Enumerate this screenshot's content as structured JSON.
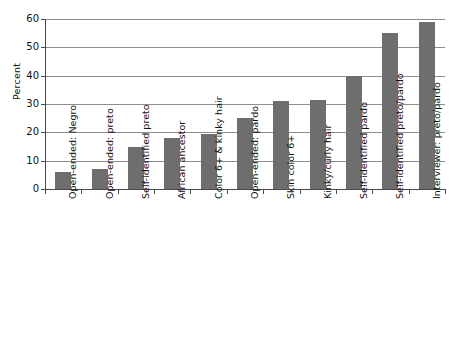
{
  "chart_data": {
    "type": "bar",
    "title": "",
    "subtitle": "",
    "xlabel": "",
    "ylabel": "Percent",
    "ylim": [
      0,
      60
    ],
    "yticks": [
      0,
      10,
      20,
      30,
      40,
      50,
      60
    ],
    "ytick_labels": [
      "0",
      "10",
      "20",
      "30",
      "40",
      "50",
      "60"
    ],
    "grid": true,
    "legend": false,
    "legend_position": "none",
    "orientation": "vertical",
    "bar_color": "#6e6e6e",
    "background_color": "#ffffff",
    "gridline_color": "#8d8d8d",
    "axis_color": "#4a4a4a",
    "categories": [
      "Open-ended: Negro",
      "Open-ended: preto",
      "Self-identified preto",
      "African ancestor",
      "Color 6+ & kinky hair",
      "Open-ended: pardo",
      "Skin color 6+",
      "Kinky/curly hair",
      "Self-identified pardo",
      "Self-identified preto/pardo",
      "Interviewer: preto/pardo"
    ],
    "values": [
      6,
      7,
      15,
      18,
      19.5,
      25,
      31,
      31.5,
      40,
      55,
      59
    ],
    "annotations": []
  }
}
